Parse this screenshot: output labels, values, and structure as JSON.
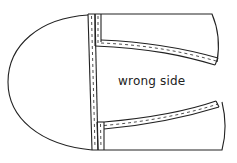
{
  "diagram": {
    "type": "sewing-pattern",
    "label": "wrong side",
    "stroke_color": "#222222",
    "fill_color": "#ffffff"
  }
}
